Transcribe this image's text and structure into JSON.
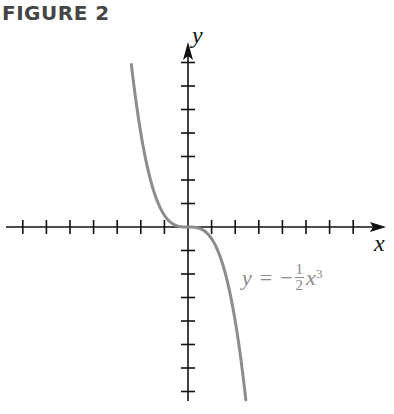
{
  "figure": {
    "title": "FIGURE 2"
  },
  "axes": {
    "x_label": "x",
    "y_label": "y",
    "origin_px": [
      188,
      227
    ],
    "unit_px_x": 23.6,
    "unit_px_y": 23.5,
    "ticks_each_side": 7
  },
  "equation": {
    "lhs": "y",
    "equals": "=",
    "sign": "−",
    "numerator": "1",
    "denominator": "2",
    "var": "x",
    "exponent": "3"
  },
  "colors": {
    "axis": "#111111",
    "curve": "#8c8c8c",
    "title": "#454545",
    "equation": "#8a8a8a"
  },
  "chart_data": {
    "type": "line",
    "title": "FIGURE 2",
    "xlabel": "x",
    "ylabel": "y",
    "function": "y = -1/2 x^3",
    "xlim": [
      -7,
      8
    ],
    "ylim": [
      -7,
      8
    ],
    "grid": false,
    "tick_spacing": 1,
    "tick_labels": "none",
    "annotations": [
      "y = −½x³"
    ],
    "series": [
      {
        "name": "y = -1/2 x^3",
        "x": [
          -2.4,
          -2.0,
          -1.5,
          -1.0,
          -0.5,
          0,
          0.5,
          1.0,
          1.5,
          2.0,
          2.45
        ],
        "y": [
          6.91,
          4.0,
          1.69,
          0.5,
          0.06,
          0,
          -0.06,
          -0.5,
          -1.69,
          -4.0,
          -7.35
        ]
      }
    ]
  }
}
